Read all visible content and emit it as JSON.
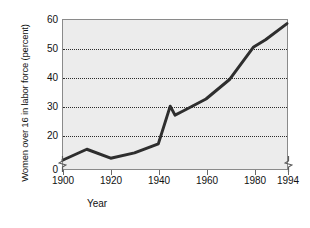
{
  "chart_data": {
    "type": "line",
    "title": "",
    "xlabel": "Year",
    "ylabel": "Women over 16 in labor force (percent)",
    "xlim": [
      1900,
      1994
    ],
    "ylim": [
      18.5,
      60
    ],
    "y_axis_break": true,
    "y_axis_break_note": "axis broken between 0 and 20",
    "grid": "horizontal-dotted",
    "gridlines": [
      20,
      30,
      40,
      50
    ],
    "legend": "none",
    "x_ticks": [
      {
        "value": 1900,
        "label": "1900"
      },
      {
        "value": 1920,
        "label": "1920"
      },
      {
        "value": 1940,
        "label": "1940"
      },
      {
        "value": 1960,
        "label": "1960"
      },
      {
        "value": 1980,
        "label": "1980"
      },
      {
        "value": 1994,
        "label": "1994"
      }
    ],
    "y_ticks": [
      {
        "value": 60,
        "label": "60"
      },
      {
        "value": 50,
        "label": "50"
      },
      {
        "value": 40,
        "label": "40"
      },
      {
        "value": 30,
        "label": "30"
      },
      {
        "value": 20,
        "label": "20"
      },
      {
        "value": 0,
        "label": "0"
      }
    ],
    "x": [
      1900,
      1910,
      1920,
      1930,
      1940,
      1945,
      1947,
      1950,
      1960,
      1970,
      1980,
      1985,
      1994
    ],
    "values": [
      21.0,
      24.0,
      21.5,
      23.0,
      25.5,
      36.0,
      33.5,
      34.5,
      38.0,
      43.5,
      52.5,
      54.5,
      59.0
    ],
    "series": [
      {
        "name": "Women over 16 in labor force",
        "values": [
          21.0,
          24.0,
          21.5,
          23.0,
          25.5,
          36.0,
          33.5,
          34.5,
          38.0,
          43.5,
          52.5,
          54.5,
          59.0
        ],
        "color": "#2e2e2e"
      }
    ],
    "style": {
      "plot_background": "#ececec",
      "frame_color": "#8a8a8a",
      "gridline_color": "#2b2b2b",
      "line_color": "#2e2e2e",
      "page_background": "#ffffff"
    }
  }
}
